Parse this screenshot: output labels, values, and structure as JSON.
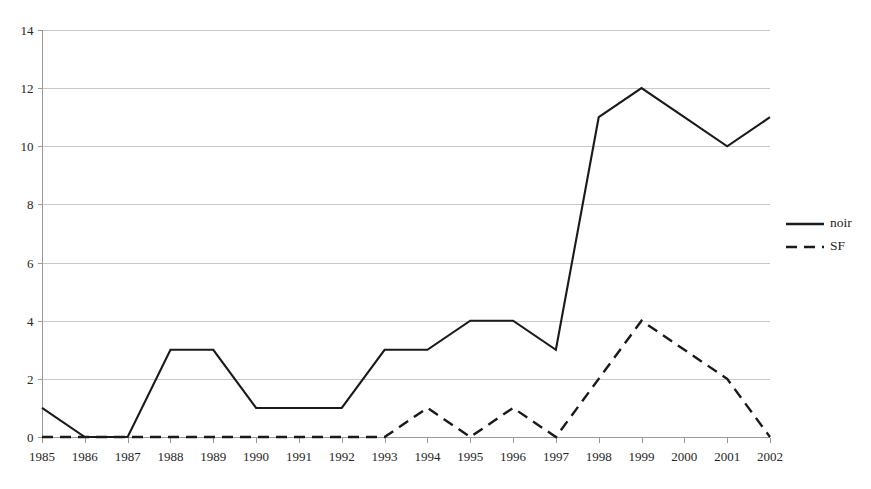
{
  "chart_data": {
    "type": "line",
    "title": "",
    "xlabel": "",
    "ylabel": "",
    "categories": [
      "1985",
      "1986",
      "1987",
      "1988",
      "1989",
      "1990",
      "1991",
      "1992",
      "1993",
      "1994",
      "1995",
      "1996",
      "1997",
      "1998",
      "1999",
      "2000",
      "2001",
      "2002"
    ],
    "series": [
      {
        "name": "noir",
        "style": "solid",
        "color": "#1a1a1a",
        "values": [
          1,
          0,
          0,
          3,
          3,
          1,
          1,
          1,
          3,
          3,
          4,
          4,
          3,
          11,
          12,
          11,
          10,
          11
        ]
      },
      {
        "name": "SF",
        "style": "dashed",
        "color": "#1a1a1a",
        "values": [
          0,
          0,
          0,
          0,
          0,
          0,
          0,
          0,
          0,
          1,
          0,
          1,
          0,
          2,
          4,
          3,
          2,
          0
        ]
      }
    ],
    "ylim": [
      0,
      14
    ],
    "yticks": [
      0,
      2,
      4,
      6,
      8,
      10,
      12,
      14
    ],
    "ytick_labels": [
      "0",
      "2",
      "4",
      "6",
      "8",
      "10",
      "12",
      "14"
    ],
    "xtick_labels": [
      "1985",
      "1986",
      "1987",
      "1988",
      "1989",
      "1990",
      "1991",
      "1992",
      "1993",
      "1994",
      "1995",
      "1996",
      "1997",
      "1998",
      "1999",
      "2000",
      "2001",
      "2002"
    ],
    "grid": "horizontal",
    "legend_position": "right",
    "legend_entries": [
      "noir",
      "SF"
    ],
    "background": "#ffffff",
    "gridline_color": "#c8c8c8",
    "axis_color": "#9a9a9a"
  },
  "layout": {
    "plot_left": 42,
    "plot_right": 770,
    "plot_top": 30,
    "plot_bottom": 437,
    "legend_x": 786,
    "legend_noir_y": 224,
    "legend_sf_y": 247
  }
}
